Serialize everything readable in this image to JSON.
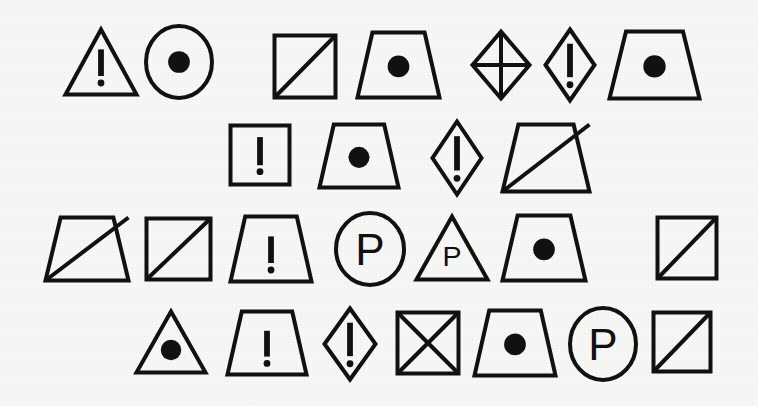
{
  "canvas": {
    "width": 758,
    "height": 406,
    "background_color": "#f7f7f5",
    "ink_color": "#111111",
    "description": "Hand-drawn style sheet of abstract warning/sign pictogram outlines"
  },
  "glyphs": [
    {
      "id": "r1c1",
      "row": 1,
      "col": 1,
      "outline": "triangle",
      "inner": "exclamation",
      "x": 63,
      "y": 27,
      "w": 76,
      "h": 70,
      "stroke": 4
    },
    {
      "id": "r1c2",
      "row": 1,
      "col": 2,
      "outline": "circle",
      "inner": "dot",
      "x": 144,
      "y": 24,
      "w": 70,
      "h": 76,
      "stroke": 4
    },
    {
      "id": "r1c3",
      "row": 1,
      "col": 3,
      "outline": "square",
      "inner": "diagonal-up",
      "x": 272,
      "y": 33,
      "w": 66,
      "h": 67,
      "stroke": 4
    },
    {
      "id": "r1c4",
      "row": 1,
      "col": 4,
      "outline": "trapezoid",
      "inner": "dot",
      "x": 355,
      "y": 30,
      "w": 87,
      "h": 70,
      "stroke": 4
    },
    {
      "id": "r1c5",
      "row": 1,
      "col": 5,
      "outline": "diamond",
      "inner": "cross",
      "x": 470,
      "y": 29,
      "w": 62,
      "h": 72,
      "stroke": 4
    },
    {
      "id": "r1c6",
      "row": 1,
      "col": 6,
      "outline": "diamond",
      "inner": "exclamation",
      "x": 543,
      "y": 27,
      "w": 54,
      "h": 76,
      "stroke": 4
    },
    {
      "id": "r1c7",
      "row": 1,
      "col": 7,
      "outline": "trapezoid",
      "inner": "dot",
      "x": 607,
      "y": 29,
      "w": 95,
      "h": 72,
      "stroke": 4
    },
    {
      "id": "r2c1",
      "row": 2,
      "col": 1,
      "outline": "square",
      "inner": "exclamation",
      "x": 228,
      "y": 123,
      "w": 64,
      "h": 64,
      "stroke": 4
    },
    {
      "id": "r2c2",
      "row": 2,
      "col": 2,
      "outline": "trapezoid",
      "inner": "dot",
      "x": 317,
      "y": 122,
      "w": 84,
      "h": 68,
      "stroke": 4
    },
    {
      "id": "r2c3",
      "row": 2,
      "col": 3,
      "outline": "diamond",
      "inner": "exclamation",
      "x": 430,
      "y": 119,
      "w": 54,
      "h": 78,
      "stroke": 4
    },
    {
      "id": "r2c4",
      "row": 2,
      "col": 4,
      "outline": "trapezoid",
      "inner": "diagonal-up",
      "x": 500,
      "y": 122,
      "w": 92,
      "h": 72,
      "stroke": 4
    },
    {
      "id": "r3c1",
      "row": 3,
      "col": 1,
      "outline": "trapezoid",
      "inner": "diagonal-up",
      "x": 43,
      "y": 215,
      "w": 88,
      "h": 68,
      "stroke": 4
    },
    {
      "id": "r3c2",
      "row": 3,
      "col": 2,
      "outline": "square",
      "inner": "diagonal-up",
      "x": 144,
      "y": 216,
      "w": 69,
      "h": 66,
      "stroke": 4
    },
    {
      "id": "r3c3",
      "row": 3,
      "col": 3,
      "outline": "trapezoid",
      "inner": "exclamation",
      "x": 228,
      "y": 214,
      "w": 86,
      "h": 70,
      "stroke": 4
    },
    {
      "id": "r3c4",
      "row": 3,
      "col": 4,
      "outline": "circle",
      "inner": "letter-P",
      "x": 334,
      "y": 211,
      "w": 72,
      "h": 76,
      "stroke": 4
    },
    {
      "id": "r3c5",
      "row": 3,
      "col": 5,
      "outline": "triangle",
      "inner": "letter-P",
      "x": 414,
      "y": 214,
      "w": 76,
      "h": 68,
      "stroke": 4
    },
    {
      "id": "r3c6",
      "row": 3,
      "col": 6,
      "outline": "trapezoid",
      "inner": "dot",
      "x": 500,
      "y": 213,
      "w": 88,
      "h": 70,
      "stroke": 4
    },
    {
      "id": "r3c7",
      "row": 3,
      "col": 7,
      "outline": "square",
      "inner": "diagonal-up",
      "x": 655,
      "y": 215,
      "w": 64,
      "h": 66,
      "stroke": 4
    },
    {
      "id": "r4c1",
      "row": 4,
      "col": 1,
      "outline": "triangle",
      "inner": "dot",
      "x": 134,
      "y": 309,
      "w": 74,
      "h": 66,
      "stroke": 4
    },
    {
      "id": "r4c2",
      "row": 4,
      "col": 2,
      "outline": "trapezoid",
      "inner": "exclamation",
      "x": 225,
      "y": 309,
      "w": 84,
      "h": 68,
      "stroke": 4
    },
    {
      "id": "r4c3",
      "row": 4,
      "col": 3,
      "outline": "diamond",
      "inner": "exclamation",
      "x": 322,
      "y": 306,
      "w": 56,
      "h": 76,
      "stroke": 4
    },
    {
      "id": "r4c4",
      "row": 4,
      "col": 4,
      "outline": "square",
      "inner": "x-cross",
      "x": 395,
      "y": 310,
      "w": 66,
      "h": 66,
      "stroke": 4
    },
    {
      "id": "r4c5",
      "row": 4,
      "col": 5,
      "outline": "trapezoid",
      "inner": "dot",
      "x": 472,
      "y": 308,
      "w": 86,
      "h": 70,
      "stroke": 4
    },
    {
      "id": "r4c6",
      "row": 4,
      "col": 6,
      "outline": "circle",
      "inner": "letter-P",
      "x": 568,
      "y": 306,
      "w": 70,
      "h": 76,
      "stroke": 4
    },
    {
      "id": "r4c7",
      "row": 4,
      "col": 7,
      "outline": "square",
      "inner": "diagonal-up",
      "x": 651,
      "y": 310,
      "w": 62,
      "h": 64,
      "stroke": 4
    }
  ],
  "legend": {
    "outline_shapes": [
      "triangle",
      "circle",
      "square",
      "trapezoid",
      "diamond"
    ],
    "inner_marks": [
      "exclamation",
      "dot",
      "diagonal-up",
      "cross",
      "x-cross",
      "letter-P"
    ],
    "letter_P_text": "P",
    "exclamation_text": "!"
  }
}
